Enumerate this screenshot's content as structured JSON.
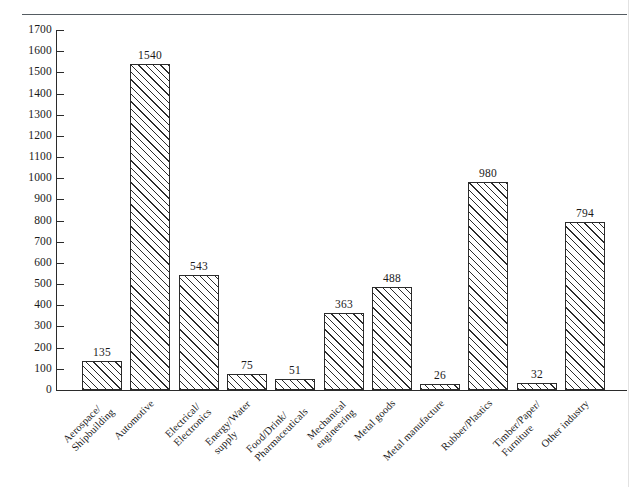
{
  "chart_data": {
    "type": "bar",
    "title": "",
    "subtitle": "",
    "xlabel": "",
    "ylabel": "",
    "ylim": [
      0,
      1700
    ],
    "ytick_step": 100,
    "yticks": [
      0,
      100,
      200,
      300,
      400,
      500,
      600,
      700,
      800,
      900,
      1000,
      1100,
      1200,
      1300,
      1400,
      1500,
      1600,
      1700
    ],
    "grid": false,
    "legend": null,
    "bar_style": {
      "fill": "#ffffff",
      "hatch": "diagonal-45",
      "edge_color": "#2b2b2b"
    },
    "value_labels_shown": true,
    "categories": [
      "Aerospace/ Shipbuilding",
      "Automotive",
      "Electrical/ Electronics",
      "Energy/Water supply",
      "Food/Drink/ Pharmaceuticals",
      "Mechanical engineering",
      "Metal goods",
      "Metal manufacture",
      "Rubber/Plastics",
      "Timber/Paper/ Furniture",
      "Other industry"
    ],
    "category_lines": [
      [
        "Aerospace/",
        "Shipbuilding"
      ],
      [
        "Automotive",
        ""
      ],
      [
        "Electrical/",
        "Electronics"
      ],
      [
        "Energy/Water",
        "supply"
      ],
      [
        "Food/Drink/",
        "Pharmaceuticals"
      ],
      [
        "Mechanical",
        "engineering"
      ],
      [
        "Metal goods",
        ""
      ],
      [
        "Metal manufacture",
        ""
      ],
      [
        "Rubber/Plastics",
        ""
      ],
      [
        "Timber/Paper/",
        "Furniture"
      ],
      [
        "Other industry",
        ""
      ]
    ],
    "values": [
      135,
      1540,
      543,
      75,
      51,
      363,
      488,
      26,
      980,
      32,
      794
    ],
    "value_label_text": [
      "135",
      "1540",
      "543",
      "75",
      "51",
      "363",
      "488",
      "26",
      "980",
      "32",
      "794"
    ],
    "ytick_labels": [
      "0",
      "100",
      "200",
      "300",
      "400",
      "500",
      "600",
      "700",
      "800",
      "900",
      "1000",
      "1100",
      "1200",
      "1300",
      "1400",
      "1500",
      "1600",
      "1700"
    ]
  }
}
